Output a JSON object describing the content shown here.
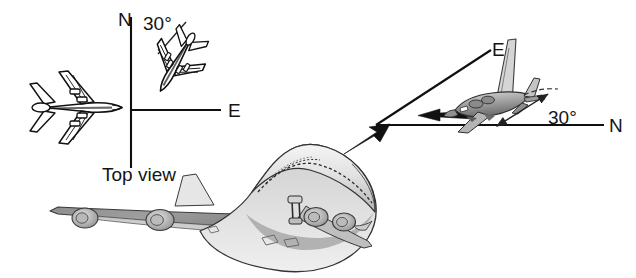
{
  "figure": {
    "background_color": "#ffffff",
    "width": 636,
    "height": 278
  },
  "top_view_panel": {
    "caption": "Top view",
    "axis_north_label": "N",
    "axis_east_label": "E",
    "angle_label": "30°",
    "origin": {
      "x": 131,
      "y": 110
    },
    "north_axis": {
      "x1": 131,
      "y1": 16,
      "x2": 131,
      "y2": 168
    },
    "east_axis": {
      "x1": 131,
      "y1": 110,
      "x2": 221,
      "y2": 110
    },
    "angle_degrees": 30,
    "aircraft_east": {
      "name": "airliner-top-view-east",
      "heading": "east",
      "tone": "#ffffff",
      "outline_color": "#111111"
    },
    "aircraft_heading": {
      "name": "airliner-top-view-heading",
      "heading": "30 degrees east of north",
      "tone": "#ffffff",
      "outline_color": "#111111"
    }
  },
  "perspective_panel": {
    "axis_east_label": "E",
    "axis_north_label": "N",
    "angle_label": "30°",
    "angle_degrees": 30,
    "origin": {
      "x": 376,
      "y": 125
    },
    "north_axis": {
      "x1": 376,
      "y1": 125,
      "x2": 604,
      "y2": 125
    },
    "east_axis": {
      "x1": 376,
      "y1": 125,
      "x2": 491,
      "y2": 50
    },
    "velocity_arrow": {
      "x1": 472,
      "y1": 115,
      "x2": 418,
      "y2": 115
    },
    "aircraft": {
      "name": "airliner-perspective-banked",
      "tone_light": "#d9d9d9",
      "tone_mid": "#9a9a9a",
      "tone_dark": "#5e5e5e"
    }
  },
  "main_aircraft": {
    "name": "boeing-747-perspective",
    "tone_highlight": "#f0f0f0",
    "tone_light": "#d2d2d2",
    "tone_mid": "#a3a3a3",
    "tone_shadow": "#7e7e7e",
    "outline_color": "#2a2a2a",
    "engine_count": 4
  },
  "callout_arrow": {
    "name": "callout-arrow",
    "from": {
      "x": 344,
      "y": 153
    },
    "to": {
      "x": 384,
      "y": 127
    },
    "color": "#111111"
  },
  "colors": {
    "ink": "#111111",
    "paper": "#ffffff",
    "gray_light": "#d9d9d9",
    "gray_mid": "#9a9a9a",
    "gray_dark": "#5e5e5e"
  }
}
